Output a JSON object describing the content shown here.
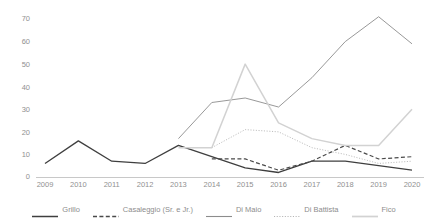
{
  "chart_data": {
    "type": "line",
    "title": "",
    "subtitle": "",
    "xlabel": "",
    "ylabel": "",
    "x": [
      2009,
      2010,
      2011,
      2012,
      2013,
      2014,
      2015,
      2016,
      2017,
      2018,
      2019,
      2020
    ],
    "xtick_labels": [
      "2009",
      "2010",
      "2011",
      "2012",
      "2013",
      "2014",
      "2015",
      "2016",
      "2017",
      "2018",
      "2019",
      "2020"
    ],
    "ytick_labels": [
      "0",
      "10",
      "20",
      "30",
      "40",
      "50",
      "60",
      "70"
    ],
    "yticks": [
      0,
      10,
      20,
      30,
      40,
      50,
      60,
      70
    ],
    "ylim": [
      0,
      75
    ],
    "grid": false,
    "legend_position": "bottom",
    "series": [
      {
        "name": "Grillo",
        "style": "solid-thick",
        "color": "#3f3f3f",
        "x": [
          2009,
          2010,
          2011,
          2012,
          2013,
          2014,
          2015,
          2016,
          2017,
          2018,
          2019,
          2020
        ],
        "values": [
          6,
          16,
          7,
          6,
          14,
          9,
          4,
          2,
          7,
          7,
          5,
          3
        ]
      },
      {
        "name": "Casaleggio (Sr. e Jr.)",
        "style": "dashed",
        "color": "#4a4a4a",
        "x": [
          2014,
          2015,
          2016,
          2017,
          2018,
          2019,
          2020
        ],
        "values": [
          8,
          8,
          3,
          7,
          14,
          8,
          9
        ]
      },
      {
        "name": "Di Maio",
        "style": "solid-thin",
        "color": "#8c8c8c",
        "x": [
          2013,
          2014,
          2015,
          2016,
          2017,
          2018,
          2019,
          2020
        ],
        "values": [
          17,
          33,
          35,
          31,
          44,
          60,
          71,
          59
        ]
      },
      {
        "name": "Di Battista",
        "style": "dotted",
        "color": "#b5b5b5",
        "x": [
          2014,
          2015,
          2016,
          2017,
          2018,
          2019,
          2020
        ],
        "values": [
          13,
          21,
          20,
          13,
          10,
          6,
          7
        ]
      },
      {
        "name": "Fico",
        "style": "solid-light",
        "color": "#d2d2d2",
        "x": [
          2013,
          2014,
          2015,
          2016,
          2017,
          2018,
          2019,
          2020
        ],
        "values": [
          13,
          13,
          50,
          24,
          17,
          14,
          14,
          30
        ]
      }
    ]
  }
}
